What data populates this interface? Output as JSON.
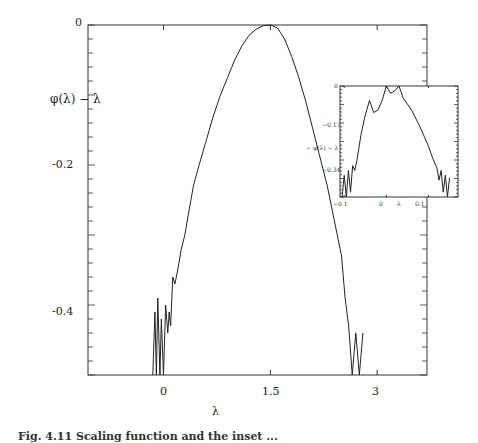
{
  "chart_data": [
    {
      "type": "line",
      "title": "",
      "xlabel": "λ",
      "ylabel": "φ(λ) − λ",
      "xlim": [
        -1.06,
        3.7
      ],
      "ylim": [
        -0.5,
        0.0
      ],
      "xticks": [
        0,
        1.5,
        3
      ],
      "xtick_labels": [
        "0",
        "1.5",
        "3"
      ],
      "yticks": [
        0,
        -0.2,
        -0.4
      ],
      "ytick_labels": [
        "0",
        "-0.2",
        "-0.4"
      ],
      "grid": false,
      "legend": null,
      "series": [
        {
          "name": "φ(λ) − λ",
          "x": [
            -0.15,
            -0.12,
            -0.1,
            -0.08,
            -0.05,
            -0.03,
            0.0,
            0.03,
            0.06,
            0.08,
            0.1,
            0.13,
            0.16,
            0.2,
            0.25,
            0.3,
            0.35,
            0.42,
            0.5,
            0.6,
            0.7,
            0.8,
            0.9,
            1.0,
            1.1,
            1.2,
            1.3,
            1.4,
            1.5,
            1.6,
            1.7,
            1.8,
            1.9,
            2.0,
            2.1,
            2.2,
            2.3,
            2.4,
            2.5,
            2.55,
            2.6,
            2.65,
            2.7,
            2.75,
            2.8
          ],
          "y": [
            -0.5,
            -0.41,
            -0.5,
            -0.39,
            -0.5,
            -0.42,
            -0.5,
            -0.4,
            -0.44,
            -0.41,
            -0.43,
            -0.36,
            -0.37,
            -0.35,
            -0.32,
            -0.3,
            -0.27,
            -0.23,
            -0.2,
            -0.165,
            -0.13,
            -0.1,
            -0.075,
            -0.05,
            -0.03,
            -0.015,
            -0.006,
            -0.001,
            0.0,
            -0.004,
            -0.02,
            -0.045,
            -0.075,
            -0.11,
            -0.15,
            -0.19,
            -0.23,
            -0.28,
            -0.33,
            -0.39,
            -0.43,
            -0.5,
            -0.44,
            -0.5,
            -0.44
          ]
        }
      ]
    },
    {
      "type": "line",
      "title": "inset",
      "xlabel": "λ",
      "ylabel": "− φ(λ) − λ",
      "xlim": [
        -0.11,
        0.17
      ],
      "ylim": [
        -0.46,
        0.0
      ],
      "xticks": [
        -0.1,
        0,
        0.1
      ],
      "xtick_labels": [
        "−0.1",
        "0",
        "0.1"
      ],
      "yticks": [
        0,
        -0.17,
        -0.34
      ],
      "ytick_labels": [
        "0",
        "−0.17",
        "−0.34"
      ],
      "grid": false,
      "series": [
        {
          "name": "inset",
          "x": [
            -0.105,
            -0.1,
            -0.095,
            -0.09,
            -0.085,
            -0.08,
            -0.075,
            -0.07,
            -0.06,
            -0.05,
            -0.04,
            -0.03,
            -0.02,
            -0.01,
            0.0,
            0.01,
            0.02,
            0.03,
            0.04,
            0.06,
            0.08,
            0.1,
            0.11,
            0.12,
            0.125,
            0.13,
            0.135,
            0.14,
            0.145,
            0.15
          ],
          "y": [
            -0.46,
            -0.37,
            -0.46,
            -0.35,
            -0.44,
            -0.33,
            -0.35,
            -0.31,
            -0.2,
            -0.12,
            -0.06,
            -0.11,
            -0.1,
            -0.06,
            0.0,
            -0.03,
            -0.02,
            0.0,
            -0.05,
            -0.1,
            -0.17,
            -0.25,
            -0.3,
            -0.34,
            -0.39,
            -0.35,
            -0.44,
            -0.37,
            -0.46,
            -0.38
          ]
        }
      ]
    }
  ],
  "main": {
    "ylabel": "φ(λ) − λ",
    "xlabel": "λ",
    "yticks": [
      "0",
      "-0.2",
      "-0.4"
    ],
    "xticks": [
      "0",
      "1.5",
      "3"
    ]
  },
  "inset": {
    "ylabel": "− φ(λ) − λ",
    "yticks": [
      "0",
      "−0.17",
      "−0.34"
    ],
    "xticks": [
      "−0.1",
      "0",
      "λ",
      "0.1"
    ]
  },
  "caption": "Fig. 4.11  Scaling function and the inset ..."
}
